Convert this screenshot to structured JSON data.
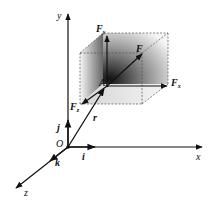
{
  "figure": {
    "type": "3D vector decomposition diagram",
    "axes": {
      "x": "x",
      "y": "y",
      "z": "z",
      "origin": "O"
    },
    "unit_vectors": {
      "i": "i",
      "j": "j",
      "k": "k"
    },
    "point": "A",
    "position_vector": "r",
    "force": {
      "main": "F",
      "x": "F",
      "y": "F",
      "z": "F",
      "x_sub": "x",
      "y_sub": "y",
      "z_sub": "z"
    }
  }
}
